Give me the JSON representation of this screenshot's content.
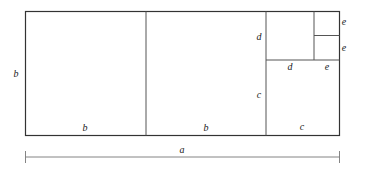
{
  "diagram": {
    "type": "rectangle decomposition into squares (Euclidean algorithm illustration)",
    "labels": {
      "left_side": "b",
      "square1_bottom": "b",
      "square2_bottom": "b",
      "square3_left": "c",
      "square3_bottom": "c",
      "square4_left": "d",
      "square4_bottom": "d",
      "bottom_e": "e",
      "small_square_top_right": "e",
      "small_square_bottom_right": "e",
      "dimension": "a"
    },
    "colors": {
      "stroke": "#333333",
      "dimension_line": "#777777",
      "background": "#ffffff"
    }
  }
}
